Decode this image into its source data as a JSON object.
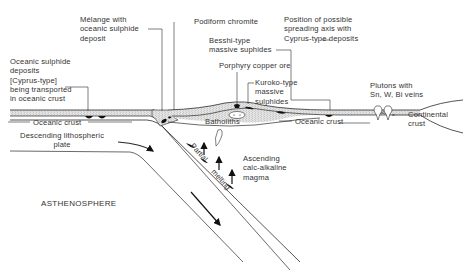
{
  "diagram": {
    "labels": {
      "melange": "Mélange with\noceanic sulphide\ndeposit",
      "podiform": "Podiform chromite",
      "spreading_axis": "Position of possible\nspreading axis with\nCyprus-type deposits",
      "besshi": "Besshi-type\nmassive suphides",
      "porphyry": "Porphyry copper ore",
      "kuroko": "Kuroko-type\nmassive\nsulphides",
      "oceanic_sulphide": "Oceanic sulphide\ndeposits\n[Cyprus-type]\nbeing transported\nin oceanic crust",
      "plutons": "Plutons with\nSn, W, Bi veins",
      "batholiths": "Batholiths",
      "oceanic_crust_left": "Oceanic crust",
      "oceanic_crust_right": "Oceanic crust",
      "continental_crust": "Continental\ncrust",
      "descending_plate": "Descending lithospheric\nplate",
      "asthenosphere": "ASTHENOSPHERE",
      "ascending_magma": "Ascending\ncalc-alkaline\nmagma",
      "partial": "Partial",
      "melting": "melting"
    },
    "colors": {
      "line": "#2a2a2a",
      "deposit": "#111111",
      "stipple": "#bdbdbd"
    }
  }
}
